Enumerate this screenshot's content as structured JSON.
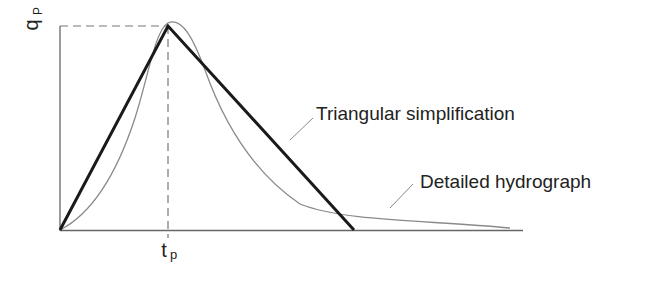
{
  "diagram": {
    "type": "hydrograph-comparison",
    "y_axis_label": {
      "main": "q",
      "sub": "P"
    },
    "x_axis_label": {
      "main": "t",
      "sub": "p"
    },
    "annotations": {
      "triangular": "Triangular simplification",
      "detailed": "Detailed hydrograph"
    },
    "series": [
      {
        "name": "Triangular simplification",
        "style": "thick-dark",
        "points_relative": [
          [
            0,
            0
          ],
          [
            1,
            1
          ],
          [
            2.72,
            0
          ]
        ]
      },
      {
        "name": "Detailed hydrograph",
        "style": "thin-gray",
        "shape": "smooth peak at tp then long recession tail"
      }
    ],
    "colors": {
      "triangle": "#1a1a1a",
      "hydrograph": "#8a8a8a",
      "axes": "#555555",
      "guides": "#777777"
    }
  }
}
